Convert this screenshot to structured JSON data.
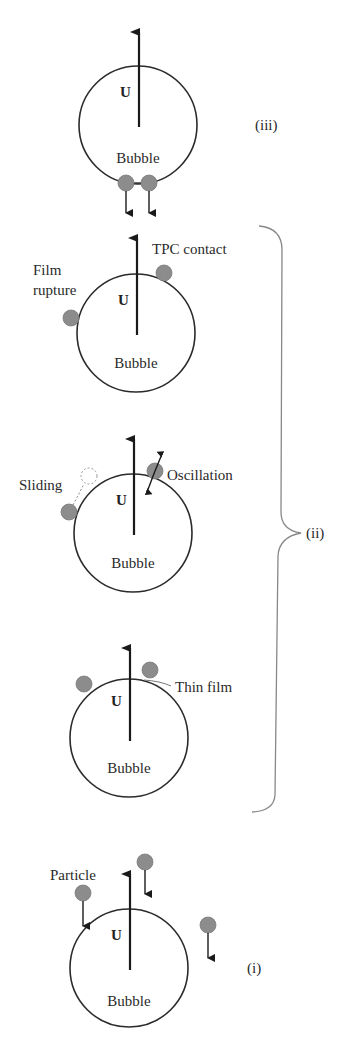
{
  "figure": {
    "velocity_label": "U",
    "bubble_label": "Bubble",
    "stages": [
      {
        "id": "iii",
        "label": "(iii)",
        "description": "Particles detaching from bubble bottom",
        "annotations": []
      },
      {
        "id": "ii-tpc",
        "group": "(ii)",
        "annotations": [
          "TPC contact",
          "Film\nrupture"
        ],
        "annotation_lines": [
          "TPC contact",
          "Film",
          "rupture"
        ]
      },
      {
        "id": "ii-sliding",
        "group": "(ii)",
        "annotations": [
          "Sliding",
          "Oscillation"
        ]
      },
      {
        "id": "ii-thinfilm",
        "group": "(ii)",
        "annotations": [
          "Thin film"
        ]
      },
      {
        "id": "i",
        "label": "(i)",
        "annotations": [
          "Particle"
        ]
      }
    ],
    "group_label": "(ii)",
    "labels": {
      "stage3": "(iii)",
      "stage2": "(ii)",
      "stage1": "(i)",
      "tpc_contact": "TPC contact",
      "film": "Film",
      "rupture": "rupture",
      "sliding": "Sliding",
      "oscillation": "Oscillation",
      "thin_film": "Thin film",
      "particle": "Particle"
    },
    "colors": {
      "particle": "#8c8c8c",
      "outline": "#2b2b2b",
      "brace": "#888888",
      "background": "#ffffff"
    }
  }
}
